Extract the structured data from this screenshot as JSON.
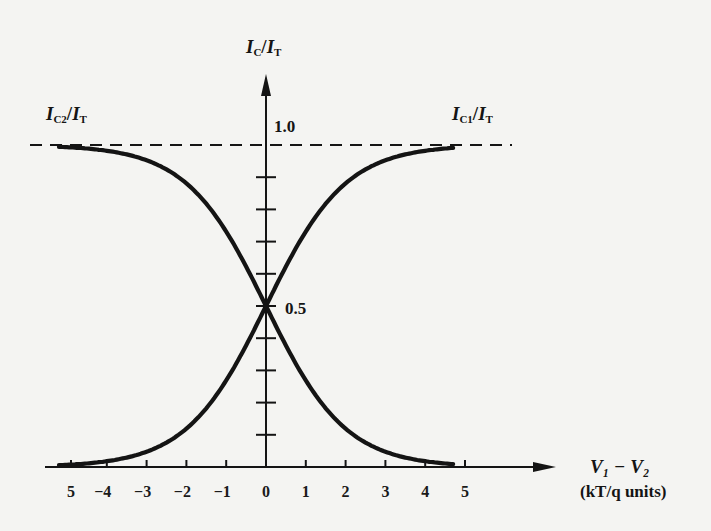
{
  "chart_data": {
    "type": "line",
    "title": "",
    "xlabel": "V1 − V2 (kT/q units)",
    "xlabel_line1": "V₁ − V₂",
    "xlabel_line2": "(kT/q units)",
    "ylabel": "IC/IT",
    "ylabel_parts": {
      "main": "I",
      "sub": "C",
      "sep": "/",
      "main2": "I",
      "sub2": "T"
    },
    "xlim": [
      -5.5,
      7
    ],
    "ylim": [
      0,
      1.0
    ],
    "x_tick_labels": [
      "5",
      "−4",
      "−3",
      "−2",
      "−1",
      "0",
      "1",
      "2",
      "3",
      "4",
      "5"
    ],
    "x_ticks": [
      -5,
      -4,
      -3,
      -2,
      -1,
      0,
      1,
      2,
      3,
      4,
      5
    ],
    "y_labeled_ticks": [
      {
        "value": 1.0,
        "label": "1.0"
      },
      {
        "value": 0.5,
        "label": "0.5"
      }
    ],
    "y_ticks": [
      0.1,
      0.2,
      0.3,
      0.4,
      0.5,
      0.6,
      0.7,
      0.8,
      0.9,
      1.0
    ],
    "reference_lines": [
      {
        "type": "horizontal",
        "y": 1.0,
        "style": "dashed"
      }
    ],
    "grid": false,
    "legend": "inline labels",
    "x": [
      -5.5,
      -5,
      -4,
      -3,
      -2,
      -1,
      0,
      1,
      2,
      3,
      4,
      5
    ],
    "series": [
      {
        "name": "IC1/IT",
        "label_main": "I",
        "label_sub": "C1",
        "label_main2": "I",
        "label_sub2": "T",
        "values": [
          0.004,
          0.007,
          0.018,
          0.047,
          0.119,
          0.269,
          0.5,
          0.731,
          0.881,
          0.953,
          0.982,
          0.993
        ]
      },
      {
        "name": "IC2/IT",
        "label_main": "I",
        "label_sub": "C2",
        "label_main2": "I",
        "label_sub2": "T",
        "values": [
          0.996,
          0.993,
          0.982,
          0.953,
          0.881,
          0.731,
          0.5,
          0.269,
          0.119,
          0.047,
          0.018,
          0.007
        ]
      }
    ],
    "annotations": [
      "Curves cross at 0.5 when V1 − V2 = 0"
    ]
  },
  "labels": {
    "y_axis": {
      "main": "I",
      "sub": "C",
      "main2": "I",
      "sub2": "T"
    },
    "ic2": {
      "main": "I",
      "sub": "C2",
      "main2": "I",
      "sub2": "T"
    },
    "ic1": {
      "main": "I",
      "sub": "C1",
      "main2": "I",
      "sub2": "T"
    },
    "y_one": "1.0",
    "y_half": "0.5",
    "x_title_1": "V₁ − V₂",
    "x_title_2": "(kT/q units)",
    "slash": "/"
  },
  "style": {
    "ink": "#141414",
    "paper": "#f4f4f2"
  }
}
